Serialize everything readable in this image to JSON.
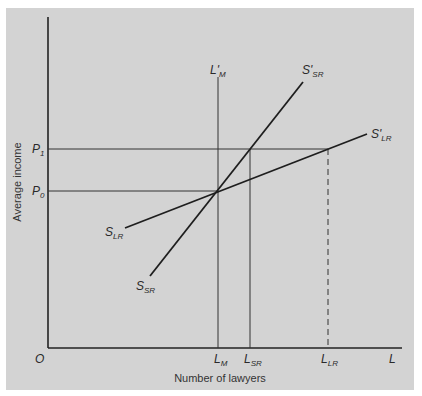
{
  "diagram": {
    "type": "supply-shift",
    "background_color": "#d3d3d3",
    "line_color": "#222222",
    "axes": {
      "x_title": "Number of lawyers",
      "y_title": "Average income",
      "origin": "O",
      "x_end": "L"
    },
    "y_ticks": [
      {
        "main": "P",
        "sub": "1"
      },
      {
        "main": "P",
        "sub": "0"
      }
    ],
    "x_ticks": [
      {
        "main": "L",
        "sub": "M"
      },
      {
        "main": "L",
        "sub": "SR"
      },
      {
        "main": "L",
        "sub": "LR"
      }
    ],
    "curves": [
      {
        "id": "S_SR",
        "start_label": {
          "main": "S",
          "sub": "SR"
        },
        "end_label": {
          "main": "S'",
          "sub": "SR"
        }
      },
      {
        "id": "S_LR",
        "start_label": {
          "main": "S",
          "sub": "LR"
        },
        "end_label": {
          "main": "S'",
          "sub": "LR"
        }
      },
      {
        "id": "L_M_prime",
        "label": {
          "main": "L'",
          "sub": "M"
        }
      }
    ]
  }
}
